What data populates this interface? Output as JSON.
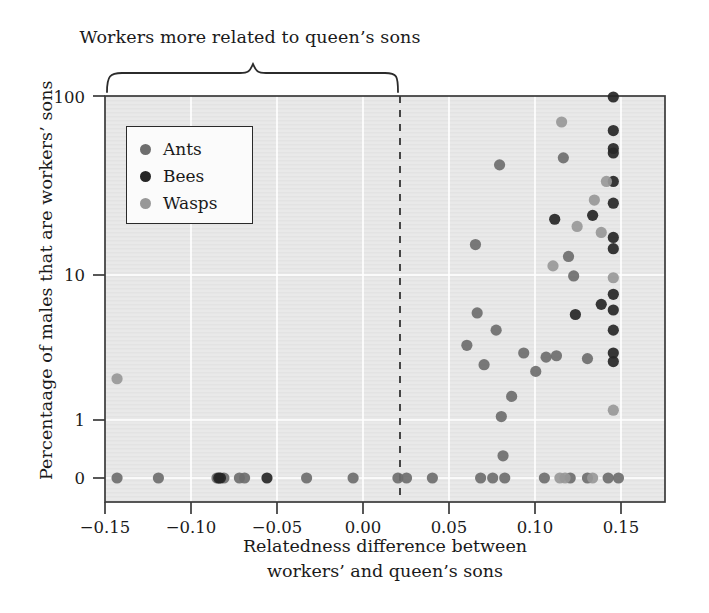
{
  "figure": {
    "annotation": "Workers more related to queen’s sons",
    "background_color": "#ffffff",
    "plot_background_color": "#e9e9e9",
    "gridline_color": "#ffffff",
    "axis_color": "#3a3a3a",
    "zero_line_style": "dashed"
  },
  "legend": {
    "position": "top-left-inside",
    "entries": [
      {
        "label": "Ants",
        "color": "#6e6e6e"
      },
      {
        "label": "Bees",
        "color": "#262626"
      },
      {
        "label": "Wasps",
        "color": "#989898"
      }
    ]
  },
  "chart_data": {
    "type": "scatter",
    "title": "",
    "annotation": "Workers more related to queen’s sons",
    "xlabel": "Relatedness difference between workers’ and queen’s sons",
    "xlabel_line1": "Relatedness difference between",
    "xlabel_line2": "workers’ and queen’s sons",
    "ylabel": "Percentaage of males that are workers’ sons",
    "xlim": [
      -0.17,
      0.155
    ],
    "ylim_log": [
      1,
      100
    ],
    "yscale": "log-with-zero",
    "grid": true,
    "legend_position": "upper-left",
    "xticks": [
      -0.15,
      -0.1,
      -0.05,
      0.0,
      0.05,
      0.1,
      0.15
    ],
    "xticklabels": [
      "−0.15",
      "−0.10",
      "−0.05",
      "0.00",
      "0.05",
      "0.10",
      "0.15"
    ],
    "yticks": [
      0,
      1,
      10,
      100
    ],
    "yticklabels": [
      "0",
      "1",
      "10",
      "100"
    ],
    "zero_reference_line_x": 0.0,
    "series": [
      {
        "name": "Ants",
        "color": "#6e6e6e",
        "points": [
          [
            -0.163,
            0
          ],
          [
            -0.139,
            0
          ],
          [
            -0.105,
            0
          ],
          [
            -0.101,
            0
          ],
          [
            -0.092,
            0
          ],
          [
            -0.089,
            0
          ],
          [
            -0.053,
            0
          ],
          [
            -0.026,
            0
          ],
          [
            0.0,
            0
          ],
          [
            0.005,
            0
          ],
          [
            0.02,
            0
          ],
          [
            0.048,
            0
          ],
          [
            0.055,
            0
          ],
          [
            0.062,
            0
          ],
          [
            0.085,
            0
          ],
          [
            0.1,
            0
          ],
          [
            0.11,
            0
          ],
          [
            0.122,
            0
          ],
          [
            0.128,
            0
          ],
          [
            0.04,
            2.9
          ],
          [
            0.046,
            4.6
          ],
          [
            0.05,
            2.2
          ],
          [
            0.057,
            3.6
          ],
          [
            0.06,
            1.05
          ],
          [
            0.061,
            0.6
          ],
          [
            0.066,
            1.4
          ],
          [
            0.073,
            2.6
          ],
          [
            0.08,
            2.0
          ],
          [
            0.086,
            2.45
          ],
          [
            0.092,
            2.5
          ],
          [
            0.096,
            42
          ],
          [
            0.099,
            10.3
          ],
          [
            0.102,
            7.8
          ],
          [
            0.11,
            2.4
          ],
          [
            0.059,
            38
          ],
          [
            0.045,
            12.2
          ]
        ]
      },
      {
        "name": "Bees",
        "color": "#262626",
        "points": [
          [
            -0.104,
            0
          ],
          [
            -0.103,
            0
          ],
          [
            -0.076,
            0
          ],
          [
            0.125,
            100
          ],
          [
            0.125,
            62
          ],
          [
            0.125,
            48
          ],
          [
            0.125,
            45
          ],
          [
            0.125,
            30
          ],
          [
            0.125,
            22
          ],
          [
            0.125,
            13.5
          ],
          [
            0.125,
            11.5
          ],
          [
            0.125,
            6.0
          ],
          [
            0.125,
            4.8
          ],
          [
            0.125,
            3.6
          ],
          [
            0.125,
            2.6
          ],
          [
            0.125,
            2.3
          ],
          [
            0.113,
            18.5
          ],
          [
            0.118,
            5.2
          ],
          [
            0.091,
            17.5
          ],
          [
            0.103,
            4.5
          ]
        ]
      },
      {
        "name": "Wasps",
        "color": "#989898",
        "points": [
          [
            -0.163,
            1.8
          ],
          [
            0.114,
            23
          ],
          [
            0.121,
            30
          ],
          [
            0.125,
            7.6
          ],
          [
            0.118,
            14.5
          ],
          [
            0.104,
            15.8
          ],
          [
            0.095,
            70
          ],
          [
            0.09,
            9.0
          ],
          [
            0.125,
            1.15
          ],
          [
            0.113,
            0
          ],
          [
            0.097,
            0
          ],
          [
            0.094,
            0
          ]
        ]
      }
    ]
  }
}
